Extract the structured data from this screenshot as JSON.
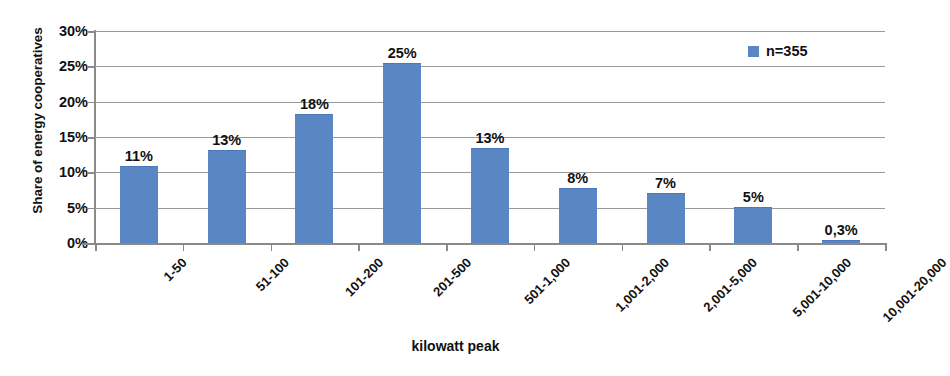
{
  "chart_data": {
    "type": "bar",
    "title": "",
    "xlabel": "kilowatt peak",
    "ylabel": "Share of energy cooperatives",
    "categories": [
      "1-50",
      "51-100",
      "101-200",
      "201-500",
      "501-1,000",
      "1,001-2,000",
      "2,001-5,000",
      "5,001-10,000",
      "10,001-20,000"
    ],
    "values": [
      10.7,
      13.0,
      18.1,
      25.4,
      13.3,
      7.7,
      7.0,
      5.0,
      0.3
    ],
    "data_labels": [
      "11%",
      "13%",
      "18%",
      "25%",
      "13%",
      "8%",
      "7%",
      "5%",
      "0,3%"
    ],
    "ylim": [
      0,
      30
    ],
    "y_ticks": [
      0,
      5,
      10,
      15,
      20,
      25,
      30
    ],
    "y_tick_labels": [
      "0%",
      "5%",
      "10%",
      "15%",
      "20%",
      "25%",
      "30%"
    ],
    "grid": true,
    "legend": {
      "position": "top-right",
      "entries": [
        {
          "label": "n=355",
          "color": "#5a86c3",
          "marker": "square"
        }
      ]
    },
    "series": [
      {
        "name": "n=355",
        "color": "#5a86c3",
        "values": [
          10.7,
          13.0,
          18.1,
          25.4,
          13.3,
          7.7,
          7.0,
          5.0,
          0.3
        ]
      }
    ],
    "colors": {
      "bar": "#5a86c3",
      "grid": "#9a9a9a",
      "axis": "#8a8a8a",
      "text": "#111111",
      "background": "#ffffff"
    }
  }
}
